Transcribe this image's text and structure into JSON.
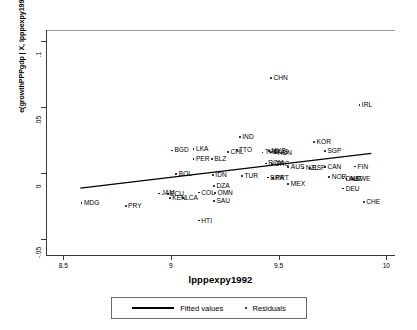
{
  "chart_data": {
    "type": "scatter",
    "title": "",
    "xlabel": "lpppexpy1992",
    "ylabel": "e(growthPPPgdp | X, lpppexpy1992) + b*lpppexpy1992",
    "xlim": [
      8.42,
      10.04
    ],
    "ylim": [
      -0.062,
      0.108
    ],
    "xticks": [
      "8.5",
      "9",
      "9.5",
      "10"
    ],
    "xtickvals": [
      8.5,
      9,
      9.5,
      10
    ],
    "yticks": [
      ".1",
      ".05",
      "0",
      "-.05"
    ],
    "ytickvals": [
      0.1,
      0.05,
      0,
      -0.05
    ],
    "grid": false,
    "legend_position": "below",
    "legend": [
      {
        "label": "Fitted values",
        "marker": "line"
      },
      {
        "label": "Residuals",
        "marker": "dot"
      }
    ],
    "fit_line": {
      "x0": 8.58,
      "y0": -0.0115,
      "x1": 9.93,
      "y1": 0.0148
    },
    "points": [
      {
        "label": "MDG",
        "x": 8.585,
        "y": -0.0225
      },
      {
        "label": "PRY",
        "x": 8.79,
        "y": -0.0252
      },
      {
        "label": "BGD",
        "x": 9.005,
        "y": 0.017
      },
      {
        "label": "JAM",
        "x": 8.945,
        "y": -0.0155
      },
      {
        "label": "ECU",
        "x": 8.985,
        "y": -0.0158
      },
      {
        "label": "KEN",
        "x": 8.995,
        "y": -0.0188
      },
      {
        "label": "LCA",
        "x": 9.055,
        "y": -0.0192
      },
      {
        "label": "BOL",
        "x": 9.025,
        "y": -0.0008
      },
      {
        "label": "LKA",
        "x": 9.105,
        "y": 0.0178
      },
      {
        "label": "PER",
        "x": 9.105,
        "y": 0.0108
      },
      {
        "label": "COL",
        "x": 9.13,
        "y": -0.0148
      },
      {
        "label": "HTI",
        "x": 9.13,
        "y": -0.036
      },
      {
        "label": "IDN",
        "x": 9.195,
        "y": -0.0018
      },
      {
        "label": "BLZ",
        "x": 9.19,
        "y": 0.0105
      },
      {
        "label": "DZA",
        "x": 9.2,
        "y": -0.0098
      },
      {
        "label": "OMN",
        "x": 9.205,
        "y": -0.0152
      },
      {
        "label": "SAU",
        "x": 9.2,
        "y": -0.0215
      },
      {
        "label": "CHL",
        "x": 9.265,
        "y": 0.016
      },
      {
        "label": "TTO",
        "x": 9.305,
        "y": 0.0175
      },
      {
        "label": "IND",
        "x": 9.32,
        "y": 0.0272
      },
      {
        "label": "TUR",
        "x": 9.33,
        "y": -0.0022
      },
      {
        "label": "THA",
        "x": 9.425,
        "y": 0.0155
      },
      {
        "label": "MYS",
        "x": 9.455,
        "y": 0.0168
      },
      {
        "label": "MUS",
        "x": 9.465,
        "y": 0.0155
      },
      {
        "label": "HUN",
        "x": 9.485,
        "y": 0.0152
      },
      {
        "label": "CHN",
        "x": 9.465,
        "y": 0.0718
      },
      {
        "label": "ROM",
        "x": 9.44,
        "y": 0.0072
      },
      {
        "label": "GRC",
        "x": 9.47,
        "y": 0.0068
      },
      {
        "label": "BRA",
        "x": 9.45,
        "y": -0.0035
      },
      {
        "label": "PRT",
        "x": 9.475,
        "y": -0.0038
      },
      {
        "label": "AUS",
        "x": 9.545,
        "y": 0.0042
      },
      {
        "label": "MEX",
        "x": 9.545,
        "y": -0.0082
      },
      {
        "label": "KOR",
        "x": 9.665,
        "y": 0.0232
      },
      {
        "label": "SGP",
        "x": 9.715,
        "y": 0.0168
      },
      {
        "label": "NZL",
        "x": 9.615,
        "y": 0.004
      },
      {
        "label": "ESP",
        "x": 9.645,
        "y": 0.0038
      },
      {
        "label": "CAN",
        "x": 9.715,
        "y": 0.0042
      },
      {
        "label": "FIN",
        "x": 9.855,
        "y": 0.0048
      },
      {
        "label": "NOR",
        "x": 9.735,
        "y": -0.0032
      },
      {
        "label": "DNK",
        "x": 9.8,
        "y": -0.0042
      },
      {
        "label": "AUT",
        "x": 9.815,
        "y": -0.0045
      },
      {
        "label": "SWE",
        "x": 9.845,
        "y": -0.0048
      },
      {
        "label": "DEU",
        "x": 9.8,
        "y": -0.0118
      },
      {
        "label": "CHE",
        "x": 9.895,
        "y": -0.0222
      },
      {
        "label": "IRL",
        "x": 9.875,
        "y": 0.0512
      }
    ]
  }
}
